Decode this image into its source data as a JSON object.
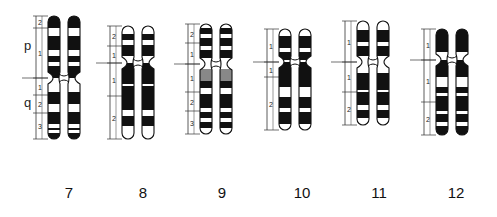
{
  "arm_labels": {
    "p": "p",
    "q": "q"
  },
  "chromosomes": [
    {
      "id": "7",
      "label": "7",
      "x": 48,
      "top": 16,
      "cen": 78,
      "bottom": 139,
      "regions": [
        {
          "n": "2",
          "y0": 16,
          "y1": 28
        },
        {
          "n": "1",
          "y0": 28,
          "y1": 78
        },
        {
          "n": "1",
          "y0": 78,
          "y1": 95
        },
        {
          "n": "2",
          "y0": 95,
          "y1": 113
        },
        {
          "n": "3",
          "y0": 113,
          "y1": 139
        }
      ],
      "bands": [
        [
          16,
          28,
          "b"
        ],
        [
          28,
          36,
          "w"
        ],
        [
          36,
          50,
          "b"
        ],
        [
          50,
          56,
          "w"
        ],
        [
          56,
          62,
          "b"
        ],
        [
          62,
          66,
          "w"
        ],
        [
          66,
          78,
          "b"
        ],
        [
          78,
          92,
          "w"
        ],
        [
          92,
          104,
          "b"
        ],
        [
          104,
          112,
          "w"
        ],
        [
          112,
          124,
          "b"
        ],
        [
          124,
          128,
          "w"
        ],
        [
          128,
          130,
          "b"
        ],
        [
          130,
          133,
          "w"
        ],
        [
          133,
          139,
          "b"
        ]
      ]
    },
    {
      "id": "8",
      "label": "8",
      "x": 122,
      "top": 26,
      "cen": 63,
      "bottom": 139,
      "regions": [
        {
          "n": "2",
          "y0": 26,
          "y1": 46
        },
        {
          "n": "1",
          "y0": 46,
          "y1": 63
        },
        {
          "n": "1",
          "y0": 63,
          "y1": 96
        },
        {
          "n": "2",
          "y0": 96,
          "y1": 139
        }
      ],
      "bands": [
        [
          26,
          34,
          "w"
        ],
        [
          34,
          40,
          "b"
        ],
        [
          40,
          45,
          "w"
        ],
        [
          45,
          56,
          "b"
        ],
        [
          56,
          63,
          "w"
        ],
        [
          63,
          84,
          "b"
        ],
        [
          84,
          86,
          "w"
        ],
        [
          86,
          110,
          "b"
        ],
        [
          110,
          116,
          "w"
        ],
        [
          116,
          126,
          "b"
        ],
        [
          126,
          139,
          "w"
        ]
      ]
    },
    {
      "id": "9",
      "label": "9",
      "x": 200,
      "top": 24,
      "cen": 64,
      "bottom": 134,
      "regions": [
        {
          "n": "2",
          "y0": 24,
          "y1": 43
        },
        {
          "n": "1",
          "y0": 43,
          "y1": 64
        },
        {
          "n": "1",
          "y0": 64,
          "y1": 92
        },
        {
          "n": "2",
          "y0": 92,
          "y1": 111
        },
        {
          "n": "3",
          "y0": 111,
          "y1": 134
        }
      ],
      "bands": [
        [
          24,
          28,
          "w"
        ],
        [
          28,
          34,
          "b"
        ],
        [
          34,
          38,
          "w"
        ],
        [
          38,
          46,
          "b"
        ],
        [
          46,
          50,
          "w"
        ],
        [
          50,
          58,
          "b"
        ],
        [
          58,
          64,
          "w"
        ],
        [
          64,
          69,
          "w"
        ],
        [
          69,
          81,
          "g"
        ],
        [
          81,
          88,
          "b"
        ],
        [
          88,
          94,
          "w"
        ],
        [
          94,
          108,
          "b"
        ],
        [
          108,
          112,
          "w"
        ],
        [
          112,
          118,
          "b"
        ],
        [
          118,
          122,
          "w"
        ],
        [
          122,
          128,
          "b"
        ],
        [
          128,
          134,
          "w"
        ]
      ]
    },
    {
      "id": "10",
      "label": "10",
      "x": 279,
      "top": 29,
      "cen": 62,
      "bottom": 130,
      "regions": [
        {
          "n": "1",
          "y0": 29,
          "y1": 62
        },
        {
          "n": "1",
          "y0": 62,
          "y1": 77
        },
        {
          "n": "2",
          "y0": 77,
          "y1": 130
        }
      ],
      "bands": [
        [
          29,
          36,
          "w"
        ],
        [
          36,
          48,
          "b"
        ],
        [
          48,
          52,
          "w"
        ],
        [
          52,
          60,
          "b"
        ],
        [
          60,
          62,
          "w"
        ],
        [
          62,
          87,
          "b"
        ],
        [
          87,
          97,
          "w"
        ],
        [
          97,
          108,
          "b"
        ],
        [
          108,
          112,
          "w"
        ],
        [
          112,
          124,
          "b"
        ],
        [
          124,
          130,
          "w"
        ]
      ]
    },
    {
      "id": "11",
      "label": "11",
      "x": 357,
      "top": 21,
      "cen": 62,
      "bottom": 125,
      "regions": [
        {
          "n": "1",
          "y0": 21,
          "y1": 62
        },
        {
          "n": "1",
          "y0": 62,
          "y1": 92
        },
        {
          "n": "2",
          "y0": 92,
          "y1": 125
        }
      ],
      "bands": [
        [
          21,
          30,
          "w"
        ],
        [
          30,
          42,
          "b"
        ],
        [
          42,
          46,
          "w"
        ],
        [
          46,
          56,
          "b"
        ],
        [
          56,
          62,
          "w"
        ],
        [
          62,
          73,
          "w"
        ],
        [
          73,
          90,
          "b"
        ],
        [
          90,
          92,
          "w"
        ],
        [
          92,
          105,
          "b"
        ],
        [
          105,
          110,
          "w"
        ],
        [
          110,
          118,
          "b"
        ],
        [
          118,
          125,
          "w"
        ]
      ]
    },
    {
      "id": "12",
      "label": "12",
      "x": 436,
      "top": 29,
      "cen": 60,
      "bottom": 135,
      "regions": [
        {
          "n": "1",
          "y0": 29,
          "y1": 60
        },
        {
          "n": "1",
          "y0": 60,
          "y1": 102
        },
        {
          "n": "2",
          "y0": 102,
          "y1": 135
        }
      ],
      "bands": [
        [
          29,
          52,
          "b"
        ],
        [
          52,
          60,
          "w"
        ],
        [
          60,
          77,
          "b"
        ],
        [
          77,
          87,
          "w"
        ],
        [
          87,
          93,
          "b"
        ],
        [
          93,
          96,
          "w"
        ],
        [
          96,
          111,
          "b"
        ],
        [
          111,
          114,
          "w"
        ],
        [
          114,
          122,
          "b"
        ],
        [
          122,
          126,
          "w"
        ],
        [
          126,
          135,
          "b"
        ]
      ]
    }
  ],
  "chromosome_labels": [
    {
      "text": "7",
      "x": 69
    },
    {
      "text": "8",
      "x": 143
    },
    {
      "text": "9",
      "x": 222
    },
    {
      "text": "10",
      "x": 302
    },
    {
      "text": "11",
      "x": 379
    },
    {
      "text": "12",
      "x": 456
    }
  ],
  "colors": {
    "band_dark": "#111111",
    "band_light": "#ffffff",
    "heterochromatin": "#888888",
    "outline": "#111111",
    "ruler": "#333333"
  }
}
